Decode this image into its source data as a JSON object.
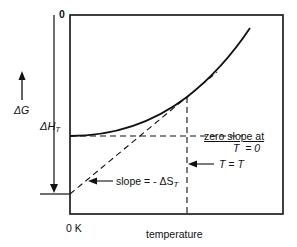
{
  "diagram": {
    "title": "",
    "y_axis": {
      "top_tick_label": "0",
      "quantity_label": "ΔG",
      "arrow_direction": "up",
      "enthalpy_label_main": "ΔH",
      "enthalpy_label_sub": "T"
    },
    "x_axis": {
      "origin_label": "0 K",
      "axis_label": "temperature"
    },
    "annotations": {
      "zero_slope_line1": "zero slope at",
      "zero_slope_line2": "T  = 0",
      "temperature_marker": "T = T",
      "slope_text_main": "slope = - ΔS",
      "slope_text_sub": "T"
    },
    "elements": [
      "curve: ΔG vs temperature (concave up, zero slope at 0 K)",
      "dashed horizontal line at ΔH_T level",
      "dashed tangent line at T with slope -ΔS_T",
      "dashed vertical line at T = T",
      "vertical bracket arrow marking ΔH_T"
    ],
    "colors": {
      "ink": "#111111",
      "background": "#ffffff"
    }
  }
}
